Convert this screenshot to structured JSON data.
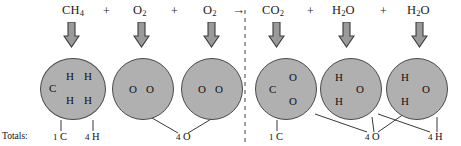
{
  "diagram": {
    "reaction_arrow": "→",
    "plus_sign": "+",
    "totals_word": "Totals:",
    "circle_fill": "#b0b0b0",
    "circle_stroke": "#4a4a4a",
    "arrow_fill": "#9a9a9a",
    "arrow_stroke": "#3a3a3a"
  },
  "reactants": {
    "formulas": [
      {
        "name": "methane",
        "main": "CH",
        "sub": "4"
      },
      {
        "name": "oxygen",
        "main": "O",
        "sub": "2"
      },
      {
        "name": "oxygen",
        "main": "O",
        "sub": "2"
      }
    ],
    "molecules": [
      {
        "name": "methane-molecule",
        "atoms": [
          "C",
          "H",
          "H",
          "H",
          "H"
        ]
      },
      {
        "name": "oxygen-molecule",
        "atoms": [
          "O",
          "O"
        ]
      },
      {
        "name": "oxygen-molecule",
        "atoms": [
          "O",
          "O"
        ]
      }
    ],
    "totals": [
      {
        "count": "1",
        "element": "C"
      },
      {
        "count": "4",
        "element": "H"
      },
      {
        "count": "4",
        "element": "O"
      }
    ]
  },
  "products": {
    "formulas": [
      {
        "name": "carbon-dioxide",
        "main": "CO",
        "sub": "2"
      },
      {
        "name": "water",
        "main": "H",
        "sub": "2",
        "tail": "O"
      },
      {
        "name": "water",
        "main": "H",
        "sub": "2",
        "tail": "O"
      }
    ],
    "molecules": [
      {
        "name": "carbon-dioxide-molecule",
        "atoms": [
          "C",
          "O",
          "O"
        ]
      },
      {
        "name": "water-molecule",
        "atoms": [
          "H",
          "H",
          "O"
        ]
      },
      {
        "name": "water-molecule",
        "atoms": [
          "H",
          "H",
          "O"
        ]
      }
    ],
    "totals": [
      {
        "count": "1",
        "element": "C"
      },
      {
        "count": "4",
        "element": "O"
      },
      {
        "count": "4",
        "element": "H"
      }
    ]
  },
  "atoms": {
    "carbon": "C",
    "hydrogen": "H",
    "oxygen": "O"
  }
}
